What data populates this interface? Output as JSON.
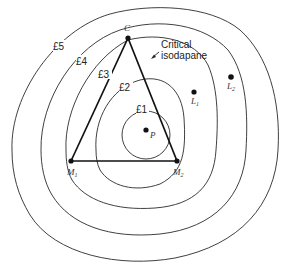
{
  "diagram": {
    "type": "isodapane-map",
    "isodapanes": [
      {
        "label": "£1",
        "value": 1
      },
      {
        "label": "£2",
        "value": 2
      },
      {
        "label": "£3",
        "value": 3,
        "critical": true
      },
      {
        "label": "£4",
        "value": 4
      },
      {
        "label": "£5",
        "value": 5
      }
    ],
    "points": {
      "C": {
        "letter": "C",
        "subscript": ""
      },
      "M1": {
        "letter": "M",
        "subscript": "1"
      },
      "M2": {
        "letter": "M",
        "subscript": "2"
      },
      "P": {
        "letter": "P",
        "subscript": ""
      },
      "L1": {
        "letter": "L",
        "subscript": "1"
      },
      "L2": {
        "letter": "L",
        "subscript": "2"
      }
    },
    "annotation": {
      "line1": "Critical",
      "line2": "isodapane"
    },
    "triangle": [
      "C",
      "M1",
      "M2"
    ]
  }
}
